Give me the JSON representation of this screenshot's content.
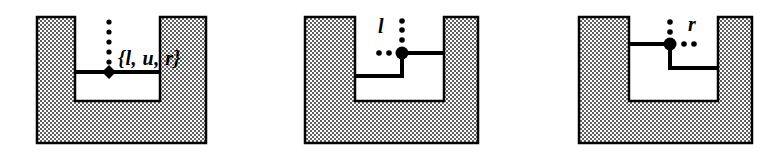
{
  "figure": {
    "title": "",
    "background_color": "#ffffff",
    "ink_color": "#000000",
    "hatch_color": "#8c8c8c",
    "panels": [
      {
        "id": "panel-left",
        "label_text": "{l, u, r}",
        "label_x": 118,
        "label_y": 50,
        "vertex_x": 109,
        "vertex_y": 72,
        "vertex_shape": "diamond",
        "dot_direction": "up",
        "description": "U-shaped notch with flat bottom, vertex on the left edge of the notch floor, dotted ray pointing up"
      },
      {
        "id": "panel-middle",
        "label_text": "l",
        "label_x": 380,
        "label_y": 18,
        "vertex_x": 402,
        "vertex_y": 53,
        "vertex_shape": "circle",
        "dot_direction": "up-and-left",
        "description": "Stepped notch, vertex at the inner corner, dotted rays pointing up and left"
      },
      {
        "id": "panel-right",
        "label_text": "r",
        "label_x": 690,
        "label_y": 18,
        "vertex_x": 670,
        "vertex_y": 44,
        "vertex_shape": "circle",
        "dot_direction": "up-and-right",
        "description": "Mirrored stepped notch, vertex at the inner corner, dotted rays pointing up and right"
      }
    ]
  }
}
